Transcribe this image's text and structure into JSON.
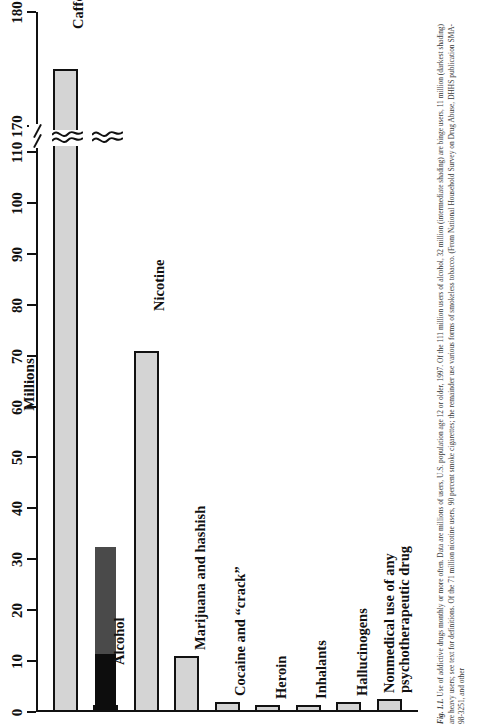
{
  "figure": {
    "number": "Fig. 1.1.",
    "caption": "Use of addictive drugs monthly or more often. Data are millions of users, U.S. population age 12 or older, 1997. Of the 111 million users of alcohol, 32 million (intermediate shading) are binge users, 11 million (darkest shading) are heavy users; see text for definitions. Of the 71 million nicotine users, 90 percent smoke cigarettes; the remainder use various forms of smokeless tobacco. (From National Household Survey on Drug Abuse, DHHS publication SMA-98-3251, and other"
  },
  "chart_data": {
    "type": "bar",
    "title": "",
    "xlabel": "",
    "ylabel": "Millions",
    "orientation": "vertical-bars-rotated",
    "ylim": [
      0,
      180
    ],
    "axis_break": {
      "from": 110,
      "to": 170
    },
    "grid": false,
    "legend": "none",
    "yticks": [
      0,
      10,
      20,
      30,
      40,
      50,
      60,
      70,
      80,
      90,
      100,
      110,
      170,
      180
    ],
    "ytick_labels": [
      "0",
      "10",
      "20",
      "30",
      "40",
      "50",
      "60",
      "70",
      "80",
      "90",
      "100",
      "110",
      "170",
      "180"
    ],
    "categories": [
      "Caffeine",
      "Alcohol",
      "Nicotine",
      "Marijuana and hashish",
      "Cocaine and “crack”",
      "Heroin",
      "Inhalants",
      "Hallucinogens",
      "Nonmedical use of any psychotherapeutic drug"
    ],
    "values": [
      175,
      111,
      71,
      11,
      2,
      0.6,
      1,
      2,
      2.5
    ],
    "segments": {
      "Alcohol": [
        {
          "name": "heavy users",
          "from": 0,
          "to": 11,
          "color": "#0d0d0d"
        },
        {
          "name": "binge users",
          "from": 11,
          "to": 32,
          "color": "#4a4a4a"
        },
        {
          "name": "other users",
          "from": 32,
          "to": 111,
          "color": "#d4d4d4"
        }
      ]
    },
    "colors": {
      "bar_fill": "#d4d4d4",
      "bar_edge": "#111111",
      "binge": "#4a4a4a",
      "heavy": "#0d0d0d"
    }
  },
  "bars": [
    {
      "label": "Caffeine",
      "value": 175,
      "label_offset": 40
    },
    {
      "label": "Alcohol",
      "value": 111,
      "label_offset": 40
    },
    {
      "label": "Nicotine",
      "value": 71,
      "label_offset": 40
    },
    {
      "label": "Marijuana and hashish",
      "value": 11,
      "label_offset": 6
    },
    {
      "label": "Cocaine and “crack”",
      "value": 2,
      "label_offset": 6
    },
    {
      "label": "Heroin",
      "value": 0.6,
      "label_offset": 6
    },
    {
      "label": "Inhalants",
      "value": 1,
      "label_offset": 6
    },
    {
      "label": "Hallucinogens",
      "value": 2,
      "label_offset": 6
    },
    {
      "label": "Nonmedical use of any",
      "label2": "psychotherapeutic drug",
      "value": 2.5,
      "label_offset": 6
    }
  ],
  "ticks": [
    {
      "label": "0"
    },
    {
      "label": "10"
    },
    {
      "label": "20"
    },
    {
      "label": "30"
    },
    {
      "label": "40"
    },
    {
      "label": "50"
    },
    {
      "label": "60"
    },
    {
      "label": "70"
    },
    {
      "label": "80"
    },
    {
      "label": "90"
    },
    {
      "label": "100"
    },
    {
      "label": "110"
    },
    {
      "label": "170"
    },
    {
      "label": "180"
    }
  ],
  "axis": {
    "title": "Millions"
  }
}
